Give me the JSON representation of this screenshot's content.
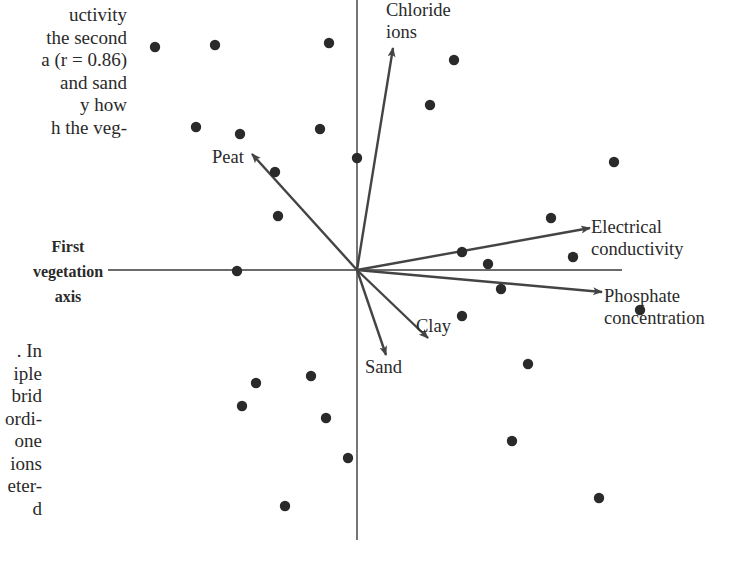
{
  "text": {
    "top_lines": [
      "uctivity",
      "the second",
      "a (r = 0.86)",
      "and sand",
      "y how",
      "h the veg-"
    ],
    "bottom_lines": [
      ". In",
      "iple",
      "brid",
      "ordi-",
      "one",
      "ions",
      "eter-",
      "  d"
    ]
  },
  "axis_label": {
    "lines": [
      "First",
      "vegetation",
      "axis"
    ]
  },
  "chart_data": {
    "type": "scatter",
    "title": "",
    "subtitle": "Ordination biplot: sites as points, environmental variables as vectors",
    "xlabel": "First vegetation axis",
    "ylabel": "",
    "grid": false,
    "legend": "none",
    "origin_px": [
      357,
      270
    ],
    "axes_px": {
      "x_range": [
        108,
        622
      ],
      "y_range": [
        0,
        540
      ]
    },
    "points_px": [
      [
        155,
        47
      ],
      [
        215,
        45
      ],
      [
        329,
        43
      ],
      [
        454,
        60
      ],
      [
        430,
        105
      ],
      [
        196,
        127
      ],
      [
        240,
        134
      ],
      [
        320,
        129
      ],
      [
        357,
        158
      ],
      [
        614,
        162
      ],
      [
        275,
        172
      ],
      [
        278,
        216
      ],
      [
        551,
        218
      ],
      [
        462,
        252
      ],
      [
        573,
        257
      ],
      [
        488,
        264
      ],
      [
        237,
        271
      ],
      [
        501,
        289
      ],
      [
        640,
        310
      ],
      [
        462,
        316
      ],
      [
        528,
        364
      ],
      [
        256,
        383
      ],
      [
        311,
        376
      ],
      [
        242,
        406
      ],
      [
        326,
        418
      ],
      [
        512,
        441
      ],
      [
        348,
        458
      ],
      [
        599,
        498
      ],
      [
        285,
        506
      ]
    ],
    "vectors": [
      {
        "name": "Chloride ions",
        "lines": [
          "Chloride",
          "ions"
        ],
        "end_px": [
          393,
          48
        ],
        "label_px": [
          386,
          16
        ],
        "anchor": "start"
      },
      {
        "name": "Peat",
        "lines": [
          "Peat"
        ],
        "end_px": [
          252,
          154
        ],
        "label_px": [
          212,
          163
        ],
        "anchor": "start"
      },
      {
        "name": "Electrical conductivity",
        "lines": [
          "Electrical",
          "conductivity"
        ],
        "end_px": [
          590,
          228
        ],
        "label_px": [
          591,
          233
        ],
        "anchor": "start"
      },
      {
        "name": "Phosphate concentration",
        "lines": [
          "Phosphate",
          "concentration"
        ],
        "end_px": [
          602,
          292
        ],
        "label_px": [
          604,
          302
        ],
        "anchor": "start"
      },
      {
        "name": "Clay",
        "lines": [
          "Clay"
        ],
        "end_px": [
          428,
          338
        ],
        "label_px": [
          416,
          332
        ],
        "anchor": "start"
      },
      {
        "name": "Sand",
        "lines": [
          "Sand"
        ],
        "end_px": [
          386,
          355
        ],
        "label_px": [
          365,
          373
        ],
        "anchor": "start"
      }
    ],
    "colors": {
      "ink": "#2a2a2a",
      "axis": "#3a3a3a",
      "arrow": "#444444"
    }
  }
}
